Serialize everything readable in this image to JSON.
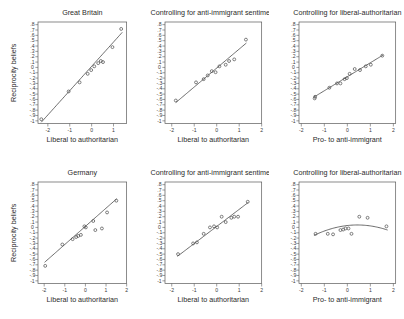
{
  "figure": {
    "background": "#ffffff",
    "rows": 2,
    "cols": 3,
    "shared_ylabel": "Reciprocity beliefs"
  },
  "chart_data": [
    {
      "type": "scatter",
      "panel_id": "gb-main",
      "row": 1,
      "col": 1,
      "title": "Great Britain",
      "xlabel": "Liberal to authoritarian",
      "ylabel": "Reciprocity beliefs",
      "xlim": [
        -2.45,
        1.6
      ],
      "ylim": [
        -1.05,
        0.85
      ],
      "xticks": [
        -2,
        -1,
        0,
        1
      ],
      "xticklabels": [
        "-2",
        "-1",
        "0",
        "1"
      ],
      "yticks": [
        0.8,
        0.7,
        0.6,
        0.5,
        0.4,
        0.3,
        0.2,
        0.1,
        0,
        -0.1,
        -0.2,
        -0.3,
        -0.4,
        -0.5,
        -0.6,
        -0.7,
        -0.8,
        -0.9,
        -1
      ],
      "yticklabels": [
        ".8",
        ".7",
        ".6",
        ".5",
        ".4",
        ".3",
        ".2",
        ".1",
        "0",
        "-.1",
        "-.2",
        "-.3",
        "-.4",
        "-.5",
        "-.6",
        "-.7",
        "-.8",
        "-.9",
        "-1"
      ],
      "grid": false,
      "legend": null,
      "x": [
        -2.3,
        -1.05,
        -0.55,
        -0.18,
        -0.02,
        0.12,
        0.3,
        0.42,
        0.52,
        0.95,
        1.35
      ],
      "y": [
        -0.97,
        -0.45,
        -0.28,
        -0.12,
        -0.05,
        0.02,
        0.08,
        0.12,
        0.1,
        0.38,
        0.72
      ],
      "fit": {
        "type": "linear",
        "intercept": 0.02,
        "slope": 0.455,
        "x_range": [
          -2.3,
          1.4
        ]
      }
    },
    {
      "type": "scatter",
      "panel_id": "gb-anti-immigrant",
      "row": 1,
      "col": 2,
      "title": "Controlling for anti-immigrant sentiment",
      "xlabel": "Liberal to authoritarian",
      "ylabel": "",
      "xlim": [
        -2.3,
        2.0
      ],
      "ylim": [
        -1.05,
        0.85
      ],
      "xticks": [
        -2,
        -1,
        0,
        1,
        2
      ],
      "xticklabels": [
        "-2",
        "-1",
        "0",
        "1",
        "2"
      ],
      "yticks": [
        0.8,
        0.7,
        0.6,
        0.5,
        0.4,
        0.3,
        0.2,
        0.1,
        0,
        -0.1,
        -0.2,
        -0.3,
        -0.4,
        -0.5,
        -0.6,
        -0.7,
        -0.8,
        -0.9,
        -1
      ],
      "yticklabels": [
        ".8",
        ".7",
        ".6",
        ".5",
        ".4",
        ".3",
        ".2",
        ".1",
        "0",
        "-.1",
        "-.2",
        "-.3",
        "-.4",
        "-.5",
        "-.6",
        "-.7",
        "-.8",
        "-.9",
        "-1"
      ],
      "grid": false,
      "legend": null,
      "x": [
        -1.82,
        -0.92,
        -0.58,
        -0.4,
        -0.22,
        -0.05,
        0.12,
        0.4,
        0.55,
        0.78,
        1.3
      ],
      "y": [
        -0.62,
        -0.28,
        -0.22,
        -0.15,
        -0.07,
        -0.09,
        0.02,
        0.05,
        0.12,
        0.15,
        0.52
      ],
      "fit": {
        "type": "linear",
        "intercept": -0.012,
        "slope": 0.355,
        "x_range": [
          -1.82,
          1.32
        ]
      }
    },
    {
      "type": "scatter",
      "panel_id": "gb-liberal-authoritarian",
      "row": 1,
      "col": 3,
      "title": "Controlling for liberal-authoritarian",
      "xlabel": "Pro- to anti-immigrant",
      "ylabel": "",
      "xlim": [
        -2.1,
        2.1
      ],
      "ylim": [
        -1.05,
        0.85
      ],
      "xticks": [
        -2,
        -1,
        0,
        1,
        2
      ],
      "xticklabels": [
        "-2",
        "-1",
        "0",
        "1",
        "2"
      ],
      "yticks": [
        0.8,
        0.7,
        0.6,
        0.5,
        0.4,
        0.3,
        0.2,
        0.1,
        0,
        -0.1,
        -0.2,
        -0.3,
        -0.4,
        -0.5,
        -0.6,
        -0.7,
        -0.8,
        -0.9,
        -1
      ],
      "yticklabels": [
        ".8",
        ".7",
        ".6",
        ".5",
        ".4",
        ".3",
        ".2",
        ".1",
        "0",
        "-.1",
        "-.2",
        "-.3",
        "-.4",
        "-.5",
        "-.6",
        "-.7",
        "-.8",
        "-.9",
        "-1"
      ],
      "grid": false,
      "legend": null,
      "x": [
        -1.42,
        -1.4,
        -0.78,
        -0.45,
        -0.3,
        -0.12,
        -0.02,
        0.1,
        0.32,
        0.55,
        0.8,
        1.02,
        1.52
      ],
      "y": [
        -0.58,
        -0.55,
        -0.38,
        -0.3,
        -0.3,
        -0.22,
        -0.2,
        -0.12,
        -0.03,
        -0.05,
        0.02,
        0.05,
        0.22
      ],
      "fit": {
        "type": "linear",
        "intercept": -0.175,
        "slope": 0.262,
        "x_range": [
          -1.45,
          1.55
        ]
      }
    },
    {
      "type": "scatter",
      "panel_id": "de-main",
      "row": 2,
      "col": 1,
      "title": "Germany",
      "xlabel": "Liberal to authoritarian",
      "ylabel": "Reciprocity beliefs",
      "xlim": [
        -2.3,
        2.0
      ],
      "ylim": [
        -1.05,
        0.85
      ],
      "xticks": [
        -2,
        -1,
        0,
        1,
        2
      ],
      "xticklabels": [
        "-2",
        "-1",
        "0",
        "1",
        "2"
      ],
      "yticks": [
        0.8,
        0.7,
        0.6,
        0.5,
        0.4,
        0.3,
        0.2,
        0.1,
        0,
        -0.1,
        -0.2,
        -0.3,
        -0.4,
        -0.5,
        -0.6,
        -0.7,
        -0.8,
        -0.9,
        -1
      ],
      "yticklabels": [
        ".8",
        ".7",
        ".6",
        ".5",
        ".4",
        ".3",
        ".2",
        ".1",
        "0",
        "-.1",
        "-.2",
        "-.3",
        "-.4",
        "-.5",
        "-.6",
        "-.7",
        "-.8",
        "-.9",
        "-1"
      ],
      "grid": false,
      "legend": null,
      "x": [
        -1.95,
        -1.12,
        -0.62,
        -0.45,
        -0.35,
        -0.22,
        -0.05,
        0.02,
        0.38,
        0.48,
        0.8,
        1.05,
        1.5
      ],
      "y": [
        -0.72,
        -0.32,
        -0.22,
        -0.18,
        -0.16,
        -0.14,
        0.02,
        0.0,
        0.12,
        -0.05,
        -0.02,
        0.28,
        0.5
      ],
      "fit": {
        "type": "linear",
        "intercept": 0.02,
        "slope": 0.34,
        "x_range": [
          -1.98,
          1.52
        ]
      }
    },
    {
      "type": "scatter",
      "panel_id": "de-anti-immigrant",
      "row": 2,
      "col": 2,
      "title": "Controlling for anti-immigrant sentiment",
      "xlabel": "Liberal to authoritarian",
      "ylabel": "",
      "xlim": [
        -2.3,
        2.0
      ],
      "ylim": [
        -1.05,
        0.85
      ],
      "xticks": [
        -2,
        -1,
        0,
        1,
        2
      ],
      "xticklabels": [
        "-2",
        "-1",
        "0",
        "1",
        "2"
      ],
      "yticks": [
        0.8,
        0.7,
        0.6,
        0.5,
        0.4,
        0.3,
        0.2,
        0.1,
        0,
        -0.1,
        -0.2,
        -0.3,
        -0.4,
        -0.5,
        -0.6,
        -0.7,
        -0.8,
        -0.9,
        -1
      ],
      "yticklabels": [
        ".8",
        ".7",
        ".6",
        ".5",
        ".4",
        ".3",
        ".2",
        ".1",
        "0",
        "-.1",
        "-.2",
        "-.3",
        "-.4",
        "-.5",
        "-.6",
        "-.7",
        "-.8",
        "-.9",
        "-1"
      ],
      "grid": false,
      "legend": null,
      "x": [
        -1.72,
        -1.05,
        -0.88,
        -0.58,
        -0.3,
        -0.12,
        0.02,
        0.22,
        0.4,
        0.65,
        0.78,
        0.95,
        1.38
      ],
      "y": [
        -0.5,
        -0.3,
        -0.28,
        -0.12,
        0.0,
        0.02,
        0.0,
        0.2,
        0.1,
        0.18,
        0.2,
        0.2,
        0.48
      ],
      "fit": {
        "type": "linear",
        "intercept": 0.018,
        "slope": 0.32,
        "x_range": [
          -1.75,
          1.4
        ]
      }
    },
    {
      "type": "scatter",
      "panel_id": "de-liberal-authoritarian",
      "row": 2,
      "col": 3,
      "title": "Controlling for liberal-authoritarian",
      "xlabel": "Pro- to anti-immigrant",
      "ylabel": "",
      "xlim": [
        -2.1,
        2.1
      ],
      "ylim": [
        -1.05,
        0.85
      ],
      "xticks": [
        -2,
        -1,
        0,
        1,
        2
      ],
      "xticklabels": [
        "-2",
        "-1",
        "0",
        "1",
        "2"
      ],
      "yticks": [
        0.8,
        0.7,
        0.6,
        0.5,
        0.4,
        0.3,
        0.2,
        0.1,
        0,
        -0.1,
        -0.2,
        -0.3,
        -0.4,
        -0.5,
        -0.6,
        -0.7,
        -0.8,
        -0.9,
        -1
      ],
      "yticklabels": [
        ".8",
        ".7",
        ".6",
        ".5",
        ".4",
        ".3",
        ".2",
        ".1",
        "0",
        "-.1",
        "-.2",
        "-.3",
        "-.4",
        "-.5",
        "-.6",
        "-.7",
        "-.8",
        "-.9",
        "-1"
      ],
      "grid": false,
      "legend": null,
      "x": [
        -1.38,
        -0.85,
        -0.62,
        -0.3,
        -0.18,
        -0.08,
        0.05,
        0.18,
        0.52,
        0.88,
        1.7
      ],
      "y": [
        -0.12,
        -0.12,
        -0.13,
        -0.05,
        -0.04,
        -0.02,
        -0.02,
        -0.12,
        0.2,
        0.18,
        0.02
      ],
      "fit": {
        "type": "quadratic",
        "a": -0.055,
        "b": 0.048,
        "c": 0.035,
        "x_range": [
          -1.45,
          1.75
        ]
      }
    }
  ]
}
